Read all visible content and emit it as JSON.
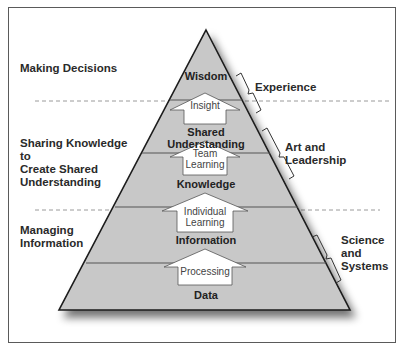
{
  "diagram": {
    "type": "knowledge-pyramid",
    "left_labels": [
      {
        "text": "Making Decisions"
      },
      {
        "text": "Sharing Knowledge to Create Shared Understanding",
        "lines": [
          "Sharing Knowledge to",
          "Create Shared",
          "Understanding"
        ]
      },
      {
        "text": "Managing Information",
        "lines": [
          "Managing",
          "Information"
        ]
      }
    ],
    "layers": [
      {
        "name": "Wisdom"
      },
      {
        "name": "Shared Understanding",
        "lines": [
          "Shared",
          "Understanding"
        ]
      },
      {
        "name": "Knowledge"
      },
      {
        "name": "Information"
      },
      {
        "name": "Data"
      }
    ],
    "transitions": [
      {
        "label": "Insight",
        "lines": [
          "Insight"
        ]
      },
      {
        "label": "Team Learning",
        "lines": [
          "Team",
          "Learning"
        ]
      },
      {
        "label": "Individual Learning",
        "lines": [
          "Individual",
          "Learning"
        ]
      },
      {
        "label": "Processing",
        "lines": [
          "Processing"
        ]
      }
    ],
    "right_labels": [
      {
        "text": "Experience"
      },
      {
        "text": "Art and Leadership",
        "lines": [
          "Art and",
          "Leadership"
        ]
      },
      {
        "text": "Science and Systems",
        "lines": [
          "Science",
          "and",
          "Systems"
        ]
      }
    ],
    "colors": {
      "pyramid_fill": "#c8c8c8",
      "outline": "#1a1a1a",
      "divider": "#9a9a9a",
      "frame": "#5a5a5a",
      "text": "#2a2a2a"
    }
  }
}
